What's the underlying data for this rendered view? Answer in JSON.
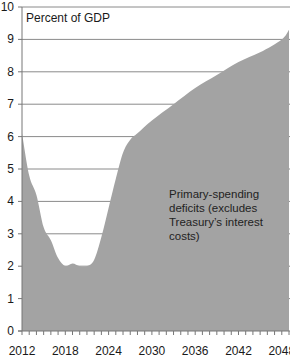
{
  "chart_data": {
    "type": "area",
    "title": "",
    "unit_label": "Percent of GDP",
    "xlabel": "",
    "ylabel": "Percent of GDP",
    "xlim": [
      2012,
      2049
    ],
    "ylim": [
      0,
      10
    ],
    "grid": true,
    "legend": null,
    "y_ticks": [
      0,
      1,
      2,
      3,
      4,
      5,
      6,
      7,
      8,
      9,
      10
    ],
    "x_tick_labels": [
      "2012",
      "2018",
      "2024",
      "2030",
      "2036",
      "2042",
      "2048"
    ],
    "x_tick_years": [
      2012,
      2018,
      2024,
      2030,
      2036,
      2042,
      2048
    ],
    "series": [
      {
        "name": "Primary-spending deficits (excludes Treasury's interest costs)",
        "color": "#a3a3a3",
        "x": [
          2012,
          2013,
          2014,
          2015,
          2016,
          2017,
          2018,
          2019,
          2020,
          2021,
          2022,
          2023,
          2024,
          2025,
          2026,
          2027,
          2028,
          2030,
          2033,
          2036,
          2039,
          2042,
          2045,
          2048,
          2049
        ],
        "values": [
          6.1,
          4.8,
          4.2,
          3.2,
          2.8,
          2.25,
          2.0,
          2.08,
          2.0,
          2.0,
          2.2,
          2.9,
          3.8,
          4.7,
          5.5,
          5.9,
          6.1,
          6.5,
          7.0,
          7.5,
          7.9,
          8.3,
          8.6,
          9.0,
          9.3
        ]
      }
    ],
    "annotations": [
      {
        "lines": [
          "Primary-spending",
          "deficits (excludes",
          "Treasury’s interest",
          "costs)"
        ]
      }
    ]
  },
  "labels": {
    "unit": "Percent of GDP",
    "annotation_line1": "Primary-spending",
    "annotation_line2": "deficits (excludes",
    "annotation_line3": "Treasury’s interest",
    "annotation_line4": "costs)"
  }
}
